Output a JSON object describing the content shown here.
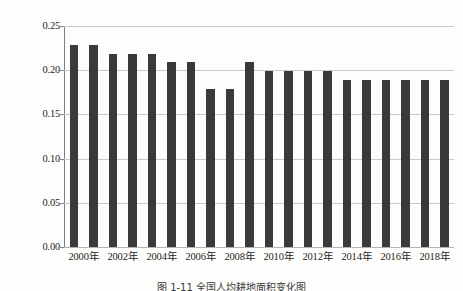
{
  "chart_data": {
    "type": "bar",
    "title": "",
    "xlabel": "",
    "ylabel": "公顷",
    "ylim": [
      0.0,
      0.25
    ],
    "yticks": [
      0.0,
      0.05,
      0.1,
      0.15,
      0.2,
      0.25
    ],
    "ytick_labels": [
      "0.00",
      "0.05",
      "0.10",
      "0.15",
      "0.20",
      "0.25"
    ],
    "grid": true,
    "legend": "none",
    "bar_color": "#3a3a3a",
    "categories": [
      "2000年",
      "2001年",
      "2002年",
      "2003年",
      "2004年",
      "2005年",
      "2006年",
      "2007年",
      "2008年",
      "2009年",
      "2010年",
      "2011年",
      "2012年",
      "2013年",
      "2014年",
      "2015年",
      "2016年",
      "2017年",
      "2018年",
      "2019年"
    ],
    "values": [
      0.229,
      0.229,
      0.218,
      0.218,
      0.218,
      0.209,
      0.209,
      0.179,
      0.179,
      0.209,
      0.199,
      0.199,
      0.199,
      0.199,
      0.189,
      0.189,
      0.189,
      0.189,
      0.189,
      0.189
    ],
    "xtick_labels": [
      "2000年",
      "2002年",
      "2004年",
      "2006年",
      "2008年",
      "2010年",
      "2012年",
      "2014年",
      "2016年",
      "2018年"
    ],
    "xtick_indices": [
      0,
      2,
      4,
      6,
      8,
      10,
      12,
      14,
      16,
      18
    ]
  },
  "caption": "图 1‑11  全国人均耕地面积变化图"
}
